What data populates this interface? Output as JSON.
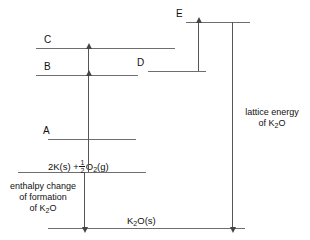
{
  "diagram": {
    "line_color": "#6e6e6e",
    "arrow_color": "#555555",
    "background": "#ffffff",
    "levels": [
      {
        "id": "E",
        "label": "E",
        "y": 22
      },
      {
        "id": "C",
        "label": "C",
        "y": 48
      },
      {
        "id": "D",
        "label": "D",
        "y": 71
      },
      {
        "id": "B",
        "label": "B",
        "y": 75
      },
      {
        "id": "A",
        "label": "A",
        "y": 139
      },
      {
        "id": "elements",
        "label": "",
        "y": 172
      },
      {
        "id": "compound",
        "label": "",
        "y": 228
      }
    ],
    "species": {
      "elements": "2K(s) + ½O₂(g)",
      "elements_parts": {
        "before": "2K(s) +",
        "frac_num": "1",
        "frac_den": "2",
        "after_o": "O",
        "after_sub": "2",
        "after_state": "(g)"
      },
      "compound": "K₂O(s)",
      "compound_parts": {
        "k": "K",
        "sub": "2",
        "o_state": "O(s)"
      }
    },
    "annotations": {
      "enthalpy": {
        "line1": "enthalpy change",
        "line2": "of formation",
        "line3_pre": "of K",
        "line3_sub": "2",
        "line3_post": "O"
      },
      "lattice": {
        "line1": "lattice energy",
        "line2_pre": "of K",
        "line2_sub": "2",
        "line2_post": "O"
      }
    },
    "arrows": [
      {
        "id": "arrow-b-to-c",
        "direction": "up"
      },
      {
        "id": "arrow-elements-to-b",
        "direction": "up"
      },
      {
        "id": "arrow-d-to-e",
        "direction": "up"
      },
      {
        "id": "arrow-enthalpy-down",
        "direction": "down"
      },
      {
        "id": "arrow-lattice-down",
        "direction": "down"
      }
    ]
  }
}
